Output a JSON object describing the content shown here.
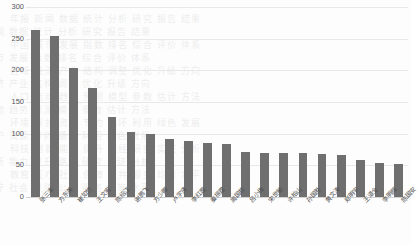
{
  "chart_data": {
    "type": "bar",
    "title": "",
    "subtitle": "",
    "xlabel": "",
    "ylabel": "",
    "ylim": [
      0,
      300
    ],
    "yticks": [
      0,
      50,
      100,
      150,
      200,
      250,
      300
    ],
    "ytick_labels": [
      "0",
      "50",
      "100",
      "150",
      "200",
      "250",
      "300"
    ],
    "grid": true,
    "legend": false,
    "legend_position": "none",
    "bar_color": "#6f6f6f",
    "categories": [
      "张三丰",
      "方东美",
      "崔如竹",
      "王文宪",
      "陈绍江",
      "谢鹏飞",
      "方少卿",
      "卢学贤",
      "李红霞",
      "秦振霆",
      "周国栋",
      "吕小梅",
      "宋世敏",
      "许柏山",
      "孙国胜",
      "黄文涛",
      "郑明宇",
      "王道全",
      "李明辉",
      "陈国安"
    ],
    "values": [
      263,
      255,
      204,
      172,
      127,
      103,
      99,
      92,
      89,
      85,
      83,
      71,
      70,
      69,
      69,
      68,
      66,
      58,
      53,
      52
    ]
  },
  "watermark": {
    "lines": [
      "年报 新闻 数据 统计 分析 研究 报告 结果",
      "中国 城市 发展 指数 排名 综合 评价 体系",
      "区域 经济 产业 结构 调整 优化 升级 方向",
      "人口 流动 趋势 预测 模型 参数 估计 方法",
      "环境 保护 资源 节约 循环 利用 绿色 发展",
      "科技 创新 能力 提升 路径 研究 实证 分析",
      "教育 医疗 社会 保障 公共 服务 均等 水平"
    ]
  }
}
